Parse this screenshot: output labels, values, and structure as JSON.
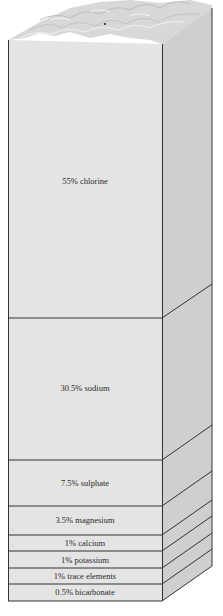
{
  "diagram": {
    "type": "stacked-column",
    "colors": {
      "front_face": "#e4e4e4",
      "side_face": "#cfcfcf",
      "top_water": "#d6d6d6",
      "lines": "#333333",
      "text": "#2a2a2a"
    },
    "layers": [
      {
        "label": "55% chlorine",
        "percent": 55,
        "element": "chlorine"
      },
      {
        "label": "30.5% sodium",
        "percent": 30.5,
        "element": "sodium"
      },
      {
        "label": "7.5% sulphate",
        "percent": 7.5,
        "element": "sulphate"
      },
      {
        "label": "3.5% magnesium",
        "percent": 3.5,
        "element": "magnesium"
      },
      {
        "label": "1% calcium",
        "percent": 1,
        "element": "calcium"
      },
      {
        "label": "1% potassium",
        "percent": 1,
        "element": "potassium"
      },
      {
        "label": "1% trace elements",
        "percent": 1,
        "element": "trace elements"
      },
      {
        "label": "0.5% bicarbonate",
        "percent": 0.5,
        "element": "bicarbonate"
      }
    ]
  }
}
